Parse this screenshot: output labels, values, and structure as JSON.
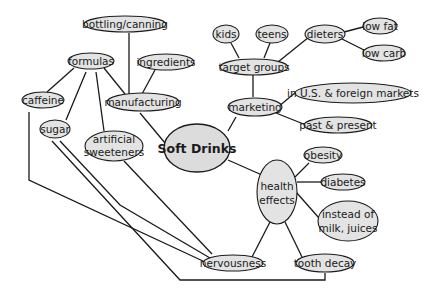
{
  "diagram": {
    "title": "Soft Drinks",
    "colors": {
      "node_fill": "#e3e3e3",
      "stroke": "#1a1a1a",
      "background": "#ffffff"
    },
    "nodes": {
      "center": {
        "label": "Soft Drinks"
      },
      "manufacturing": {
        "label": "manufacturing"
      },
      "bottling": {
        "label": "bottling/canning"
      },
      "ingredients": {
        "label": "ingredients"
      },
      "formulas": {
        "label": "formulas"
      },
      "caffeine": {
        "label": "caffeine"
      },
      "sugar": {
        "label": "sugar"
      },
      "artificial_1": {
        "label": "artificial"
      },
      "artificial_2": {
        "label": "sweeteners"
      },
      "marketing": {
        "label": "marketing"
      },
      "target_groups": {
        "label": "target groups"
      },
      "kids": {
        "label": "kids"
      },
      "teens": {
        "label": "teens"
      },
      "dieters": {
        "label": "dieters"
      },
      "low_fat": {
        "label": "low fat"
      },
      "low_carb": {
        "label": "low carb"
      },
      "markets": {
        "label": "in U.S. & foreign markets"
      },
      "past_present": {
        "label": "past & present"
      },
      "health_1": {
        "label": "health"
      },
      "health_2": {
        "label": "effects"
      },
      "obesity": {
        "label": "obesity"
      },
      "diabetes": {
        "label": "diabetes"
      },
      "instead_1": {
        "label": "instead of"
      },
      "instead_2": {
        "label": "milk, juices"
      },
      "nervousness": {
        "label": "nervousness"
      },
      "tooth_decay": {
        "label": "tooth decay"
      }
    }
  }
}
